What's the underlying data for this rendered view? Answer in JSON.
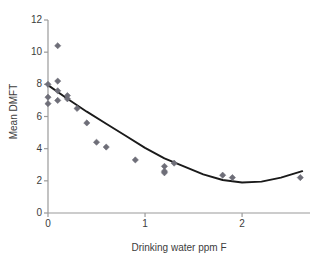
{
  "chart_data": {
    "type": "scatter",
    "title": "",
    "xlabel": "Drinking water ppm F",
    "ylabel": "Mean DMFT",
    "xlim": [
      0,
      2.7
    ],
    "ylim": [
      0,
      12
    ],
    "xticks": [
      0,
      1,
      2
    ],
    "xtick_labels": [
      "0",
      "1",
      "2"
    ],
    "yticks": [
      0,
      2,
      4,
      6,
      8,
      10,
      12
    ],
    "ytick_labels": [
      "0",
      "2",
      "4",
      "6",
      "8",
      "10",
      "12"
    ],
    "grid": false,
    "legend": false,
    "marker": "diamond",
    "marker_color": "#6e6e78",
    "line_color": "#1a1a1a",
    "axis_color": "#9a9a9a",
    "series": [
      {
        "name": "Observed mean DMFT",
        "type": "scatter",
        "points": [
          {
            "x": 0.0,
            "y": 8.0
          },
          {
            "x": 0.0,
            "y": 7.2
          },
          {
            "x": 0.0,
            "y": 6.8
          },
          {
            "x": 0.1,
            "y": 10.4
          },
          {
            "x": 0.1,
            "y": 8.2
          },
          {
            "x": 0.1,
            "y": 7.6
          },
          {
            "x": 0.1,
            "y": 7.0
          },
          {
            "x": 0.2,
            "y": 7.3
          },
          {
            "x": 0.2,
            "y": 7.1
          },
          {
            "x": 0.3,
            "y": 6.5
          },
          {
            "x": 0.4,
            "y": 5.6
          },
          {
            "x": 0.5,
            "y": 4.4
          },
          {
            "x": 0.6,
            "y": 4.1
          },
          {
            "x": 0.9,
            "y": 3.3
          },
          {
            "x": 1.2,
            "y": 2.9
          },
          {
            "x": 1.2,
            "y": 2.6
          },
          {
            "x": 1.2,
            "y": 2.5
          },
          {
            "x": 1.3,
            "y": 3.1
          },
          {
            "x": 1.8,
            "y": 2.35
          },
          {
            "x": 1.9,
            "y": 2.2
          },
          {
            "x": 2.6,
            "y": 2.2
          }
        ]
      },
      {
        "name": "Fitted quadratic curve",
        "type": "line",
        "points": [
          {
            "x": 0.0,
            "y": 7.95
          },
          {
            "x": 0.2,
            "y": 7.1
          },
          {
            "x": 0.4,
            "y": 6.3
          },
          {
            "x": 0.6,
            "y": 5.55
          },
          {
            "x": 0.8,
            "y": 4.8
          },
          {
            "x": 1.0,
            "y": 4.05
          },
          {
            "x": 1.2,
            "y": 3.4
          },
          {
            "x": 1.4,
            "y": 2.9
          },
          {
            "x": 1.6,
            "y": 2.4
          },
          {
            "x": 1.8,
            "y": 2.05
          },
          {
            "x": 2.0,
            "y": 1.9
          },
          {
            "x": 2.2,
            "y": 1.95
          },
          {
            "x": 2.4,
            "y": 2.2
          },
          {
            "x": 2.62,
            "y": 2.6
          }
        ]
      }
    ]
  },
  "caption_artifact": ""
}
